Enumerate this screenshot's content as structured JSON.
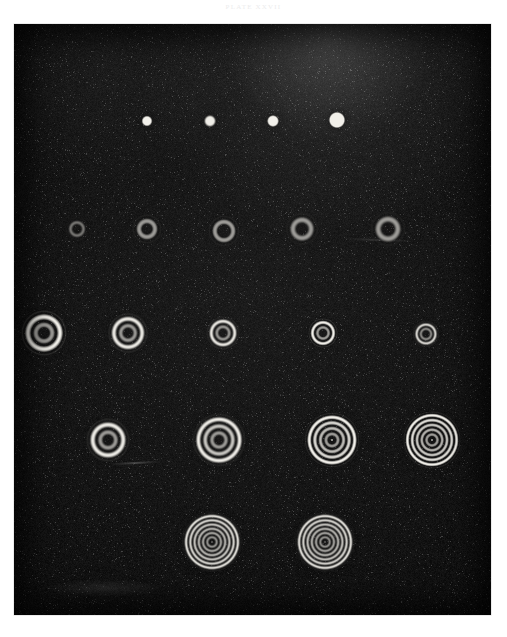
{
  "page": {
    "running_head": "PLATE  XXVII",
    "background_color": "#ffffff"
  },
  "plate": {
    "name": "interference-ring-plate",
    "background_color": "#070707",
    "frame": {
      "x": 14,
      "y": 24,
      "width": 477,
      "height": 591
    },
    "description": "Photographic plate showing rows of concentric interference ring (Newton's rings / Airy disk) exposures of increasing order",
    "ring_light_color": "#f2f0ea",
    "ring_dark_color": "#050505"
  },
  "chart_data": {
    "type": "scatter",
    "title": "PLATE  XXVII",
    "xlabel": "",
    "ylabel": "",
    "xlim": [
      0,
      477
    ],
    "ylim": [
      0,
      591
    ],
    "grid": false,
    "legend": null,
    "rows": [
      {
        "row": 1,
        "label": "row-1-points",
        "y": 97,
        "ring_count": 0,
        "patterns": [
          {
            "cx": 133,
            "cy": 97,
            "outer_r": 5.0,
            "rings": 0,
            "core_r": 4.6,
            "brightness": 0.93
          },
          {
            "cx": 196,
            "cy": 97,
            "outer_r": 5.4,
            "rings": 0,
            "core_r": 5.0,
            "brightness": 0.9
          },
          {
            "cx": 259,
            "cy": 97,
            "outer_r": 5.6,
            "rings": 0,
            "core_r": 5.2,
            "brightness": 0.92
          },
          {
            "cx": 323,
            "cy": 96,
            "outer_r": 8.0,
            "rings": 0,
            "core_r": 7.4,
            "brightness": 1.0
          }
        ]
      },
      {
        "row": 2,
        "label": "row-2-annuli",
        "y": 205,
        "ring_count": 1,
        "patterns": [
          {
            "cx": 63,
            "cy": 205,
            "outer_r": 9.5,
            "rings": 1,
            "core_r": 3.4,
            "brightness": 0.72
          },
          {
            "cx": 133,
            "cy": 205,
            "outer_r": 12.0,
            "rings": 1,
            "core_r": 3.8,
            "brightness": 0.95
          },
          {
            "cx": 210,
            "cy": 207,
            "outer_r": 13.0,
            "rings": 1,
            "core_r": 5.2,
            "brightness": 0.97
          },
          {
            "cx": 288,
            "cy": 205,
            "outer_r": 13.5,
            "rings": 1,
            "core_r": 4.6,
            "brightness": 0.98
          },
          {
            "cx": 374,
            "cy": 205,
            "outer_r": 14.5,
            "rings": 1,
            "core_r": 5.0,
            "brightness": 0.98
          }
        ]
      },
      {
        "row": 3,
        "label": "row-3-double-rings",
        "y": 309,
        "ring_count": 2,
        "patterns": [
          {
            "cx": 30,
            "cy": 309,
            "outer_r": 20.0,
            "rings": 2,
            "core_r": 4.2,
            "brightness": 0.97
          },
          {
            "cx": 114,
            "cy": 309,
            "outer_r": 17.5,
            "rings": 2,
            "core_r": 3.8,
            "brightness": 0.97
          },
          {
            "cx": 209,
            "cy": 309,
            "outer_r": 14.5,
            "rings": 2,
            "core_r": 3.4,
            "brightness": 0.96
          },
          {
            "cx": 309,
            "cy": 309,
            "outer_r": 13.0,
            "rings": 2,
            "core_r": 3.0,
            "brightness": 0.95
          },
          {
            "cx": 412,
            "cy": 310,
            "outer_r": 11.5,
            "rings": 2,
            "core_r": 3.0,
            "brightness": 0.92
          }
        ]
      },
      {
        "row": 4,
        "label": "row-4-multi-rings",
        "y": 416,
        "ring_count": 4,
        "patterns": [
          {
            "cx": 94,
            "cy": 416,
            "outer_r": 19.0,
            "rings": 2,
            "core_r": 4.0,
            "brightness": 0.97
          },
          {
            "cx": 205,
            "cy": 416,
            "outer_r": 24.0,
            "rings": 3,
            "core_r": 3.6,
            "brightness": 0.98
          },
          {
            "cx": 318,
            "cy": 416,
            "outer_r": 25.5,
            "rings": 4,
            "core_r": 3.2,
            "brightness": 0.97
          },
          {
            "cx": 418,
            "cy": 416,
            "outer_r": 27.0,
            "rings": 5,
            "core_r": 3.0,
            "brightness": 0.96
          }
        ]
      },
      {
        "row": 5,
        "label": "row-5-large-rings",
        "y": 518,
        "ring_count": 6,
        "patterns": [
          {
            "cx": 198,
            "cy": 518,
            "outer_r": 28.0,
            "rings": 6,
            "core_r": 2.6,
            "brightness": 0.98
          },
          {
            "cx": 311,
            "cy": 518,
            "outer_r": 28.0,
            "rings": 6,
            "core_r": 2.6,
            "brightness": 0.97
          }
        ]
      }
    ]
  }
}
